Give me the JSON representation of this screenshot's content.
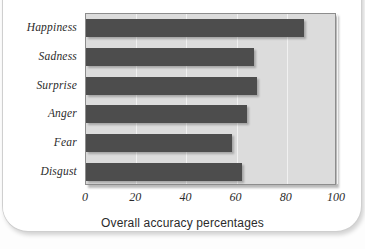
{
  "card": {
    "background_color": "#ffffff",
    "border_color": "#cfcfcf"
  },
  "chart_data": {
    "type": "bar",
    "orientation": "horizontal",
    "title": "",
    "subtitle": "",
    "xlabel": "Overall accuracy percentages",
    "ylabel": "",
    "categories": [
      "Happiness",
      "Sadness",
      "Surprise",
      "Anger",
      "Fear",
      "Disgust"
    ],
    "values": [
      87,
      67,
      68,
      64,
      58,
      62
    ],
    "xlim": [
      0,
      100
    ],
    "xticks": [
      0,
      20,
      40,
      60,
      80,
      100
    ],
    "xticklabels": [
      "0",
      "20",
      "40",
      "60",
      "80",
      "100"
    ],
    "grid": true,
    "grid_axis": "x",
    "legend": false,
    "bar_color": "#4d4d4d",
    "plot_background_color": "#dcdcdc",
    "axis_border_color": "#8d8d8d"
  }
}
